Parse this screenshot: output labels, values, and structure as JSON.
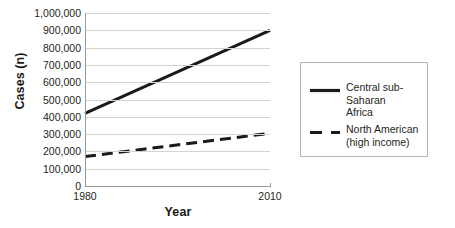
{
  "chart_data": {
    "type": "line",
    "title": "",
    "xlabel": "Year",
    "ylabel": "Cases (n)",
    "x": [
      1980,
      2010
    ],
    "xlim": [
      1980,
      2010
    ],
    "ylim": [
      0,
      1000000
    ],
    "xtick_labels": [
      "1980",
      "2010"
    ],
    "ytick_labels": [
      "1,000,000",
      "900,000",
      "800,000",
      "700,000",
      "600,000",
      "500,000",
      "400,000",
      "300,000",
      "200,000",
      "100,000",
      "0"
    ],
    "ytick_values": [
      1000000,
      900000,
      800000,
      700000,
      600000,
      500000,
      400000,
      300000,
      200000,
      100000,
      0
    ],
    "grid": "horizontal",
    "legend_position": "right-outside",
    "series": [
      {
        "name": "Central sub-Saharan Africa",
        "legend_label": "Central sub-Saharan\nAfrica",
        "style": "solid",
        "color": "#1a1a1a",
        "width": 3,
        "values": [
          420000,
          900000
        ]
      },
      {
        "name": "North American (high income)",
        "legend_label": "North American\n(high income)",
        "style": "dashed",
        "color": "#1a1a1a",
        "width": 3,
        "values": [
          170000,
          305000
        ]
      }
    ],
    "colors": {
      "background": "#ffffff",
      "grid": "#d4d4d4",
      "axis": "#9a9a9a",
      "text": "#231f20",
      "series": "#1a1a1a"
    }
  }
}
